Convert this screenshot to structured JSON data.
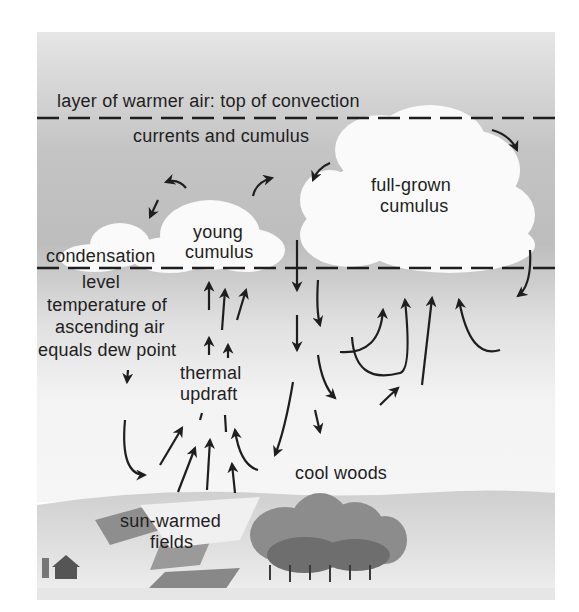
{
  "diagram": {
    "type": "atmospheric convection illustration",
    "labels": {
      "top_layer_line1": "layer of warmer air: top of convection",
      "top_layer_line2": "currents and cumulus",
      "full_grown_cumulus_line1": "full-grown",
      "full_grown_cumulus_line2": "cumulus",
      "young_cumulus_line1": "young",
      "young_cumulus_line2": "cumulus",
      "condensation_line1": "condensation",
      "condensation_line2": "level",
      "dew_point_line1": "temperature of",
      "dew_point_line2": "ascending air",
      "dew_point_line3": "equals dew point",
      "thermal_updraft_line1": "thermal",
      "thermal_updraft_line2": "updraft",
      "cool_woods": "cool woods",
      "sun_warmed_fields_line1": "sun-warmed",
      "sun_warmed_fields_line2": "fields"
    },
    "colors": {
      "sky_upper": "#b8b8b8",
      "sky_lower": "#f2f2f2",
      "cloud": "#fafafa",
      "ink": "#1e1e1e",
      "field_dark": "#8a8a8a",
      "field_light": "#d8d8d8",
      "ground": "#e4e4e4"
    },
    "lines": {
      "top_of_convection_y": 118,
      "condensation_level_y": 268
    }
  }
}
